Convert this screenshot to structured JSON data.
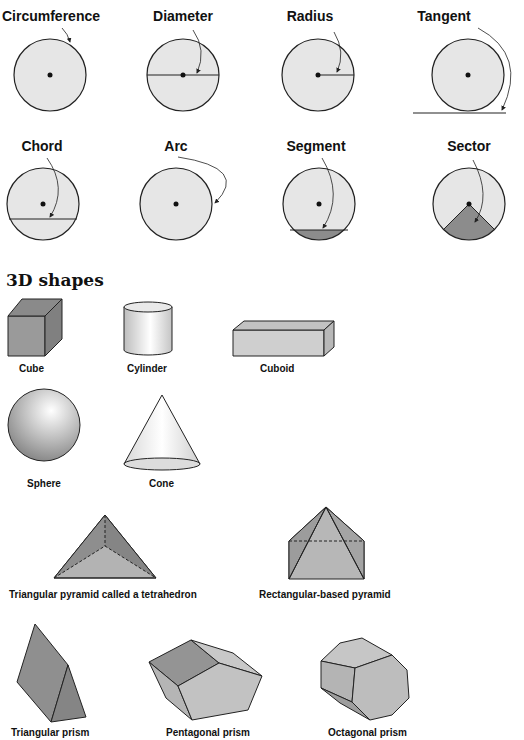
{
  "circle_parts": [
    {
      "label": "Circumference"
    },
    {
      "label": "Diameter"
    },
    {
      "label": "Radius"
    },
    {
      "label": "Tangent"
    },
    {
      "label": "Chord"
    },
    {
      "label": "Arc"
    },
    {
      "label": "Segment"
    },
    {
      "label": "Sector"
    }
  ],
  "section_title": "3D shapes",
  "shapes": [
    {
      "label": "Cube"
    },
    {
      "label": "Cylinder"
    },
    {
      "label": "Cuboid"
    },
    {
      "label": "Sphere"
    },
    {
      "label": "Cone"
    },
    {
      "label": "Triangular pyramid called a tetrahedron"
    },
    {
      "label": "Rectangular-based pyramid"
    },
    {
      "label": "Triangular prism"
    },
    {
      "label": "Pentagonal prism"
    },
    {
      "label": "Octagonal prism"
    }
  ],
  "colors": {
    "circle_fill": "#e6e6e6",
    "shaded_fill": "#8c8c8c",
    "outline": "#222222"
  }
}
